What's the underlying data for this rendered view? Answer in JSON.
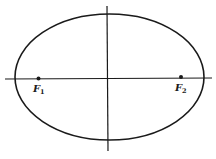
{
  "diagram": {
    "type": "ellipse-with-foci",
    "colors": {
      "line": "#1a1a1a",
      "background": "#ffffff"
    },
    "ellipse": {
      "cx": 109.5,
      "cy": 77,
      "rx": 94.5,
      "ry": 63
    },
    "axes": {
      "horizontal": {
        "x1": 5,
        "y1": 79,
        "x2": 212,
        "y2": 78
      },
      "vertical": {
        "x1": 107,
        "y1": 6,
        "x2": 108,
        "y2": 151
      }
    },
    "foci": [
      {
        "id": "F1",
        "letter": "F",
        "subscript": "1",
        "x": 38.5,
        "y": 78.5
      },
      {
        "id": "F2",
        "letter": "F",
        "subscript": "2",
        "x": 181,
        "y": 77
      }
    ]
  }
}
